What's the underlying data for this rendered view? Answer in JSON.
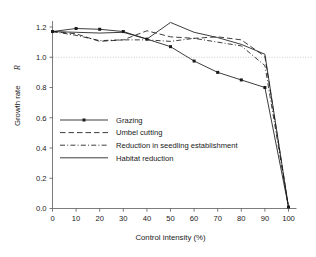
{
  "chart_data": {
    "type": "line",
    "title": "",
    "xlabel": "Control intensity (%)",
    "ylabel": "Growth rate R",
    "ylabel_plain": "Growth rate",
    "ylabel_symbol": "R",
    "xlim": [
      0,
      100
    ],
    "ylim": [
      0.0,
      1.2
    ],
    "xticks": [
      0,
      10,
      20,
      30,
      40,
      50,
      60,
      70,
      80,
      90,
      100
    ],
    "xtick_labels": [
      "0",
      "10",
      "20",
      "30",
      "40",
      "50",
      "60",
      "70",
      "80",
      "90",
      "100"
    ],
    "yticks": [
      0.0,
      0.2,
      0.4,
      0.6,
      0.8,
      1.0,
      1.2
    ],
    "ytick_labels": [
      "0.0",
      "0.2",
      "0.4",
      "0.6",
      "0.8",
      "1.0",
      "1.2"
    ],
    "grid": false,
    "reference_lines": [
      {
        "name": "replacement-threshold",
        "axis": "y",
        "value": 1.0,
        "style": "dotted",
        "color": "#b4b4b4"
      }
    ],
    "legend_position": "center-left",
    "x": [
      0,
      10,
      20,
      30,
      40,
      50,
      60,
      70,
      80,
      90,
      100
    ],
    "series": [
      {
        "name": "Grazing",
        "style": "solid-markers",
        "marker": "square",
        "color": "#1a1a1a",
        "values": [
          1.17,
          1.19,
          1.185,
          1.17,
          1.12,
          1.07,
          0.975,
          0.9,
          0.85,
          0.8,
          0.01
        ]
      },
      {
        "name": "Umbel cutting",
        "style": "dashed",
        "marker": "none",
        "color": "#1a1a1a",
        "values": [
          1.17,
          1.155,
          1.105,
          1.115,
          1.175,
          1.135,
          1.125,
          1.135,
          1.115,
          1.005,
          0.01
        ]
      },
      {
        "name": "Reduction in seedling establishment",
        "style": "dash-dot",
        "marker": "none",
        "color": "#1a1a1a",
        "values": [
          1.17,
          1.145,
          1.11,
          1.115,
          1.115,
          1.105,
          1.125,
          1.1,
          1.075,
          0.945,
          0.01
        ]
      },
      {
        "name": "Habitat reduction",
        "style": "solid",
        "marker": "none",
        "color": "#1a1a1a",
        "values": [
          1.17,
          1.165,
          1.16,
          1.165,
          1.12,
          1.23,
          1.165,
          1.13,
          1.085,
          1.02,
          0.01
        ]
      }
    ]
  },
  "legend": {
    "items": [
      {
        "label": "Grazing",
        "style": "solid-markers"
      },
      {
        "label": "Umbel cutting",
        "style": "dashed"
      },
      {
        "label": "Reduction in seedling establishment",
        "style": "dash-dot"
      },
      {
        "label": "Habitat reduction",
        "style": "solid"
      }
    ]
  },
  "axes": {
    "x_title": "Control intensity (%)",
    "y_title_text": "Growth rate",
    "y_title_symbol": "R"
  }
}
